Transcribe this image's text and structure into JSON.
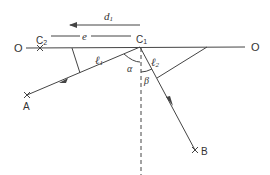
{
  "diagram": {
    "labels": {
      "o_left": "O",
      "o_right": "O",
      "c2": "C",
      "c2_sub": "2",
      "c1": "C",
      "c1_sub": "1",
      "d1": "d",
      "d1_sub": "1",
      "e": "e",
      "l1": "ℓ",
      "l1_sub": "1",
      "l2": "ℓ",
      "l2_sub": "2",
      "alpha": "α",
      "beta": "β",
      "a": "A",
      "b": "B"
    },
    "colors": {
      "stroke": "#444444",
      "background": "#ffffff"
    }
  }
}
